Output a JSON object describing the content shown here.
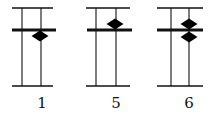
{
  "diagram": {
    "type": "abacus",
    "line_color": "#111111",
    "bead_color": "#000000",
    "frames": [
      {
        "label": "1",
        "top_line": {
          "x1": 12,
          "x2": 53,
          "y": 8
        },
        "bar": {
          "x1": 12,
          "x2": 56,
          "y": 30
        },
        "bottom_line": {
          "x1": 12,
          "x2": 53,
          "y": 86
        },
        "rods": [
          22,
          41
        ],
        "beads": [
          {
            "cx": 40,
            "cy": 36
          }
        ],
        "label_x": 42
      },
      {
        "label": "5",
        "top_line": {
          "x1": 86,
          "x2": 130,
          "y": 8
        },
        "bar": {
          "x1": 87,
          "x2": 132,
          "y": 30
        },
        "bottom_line": {
          "x1": 86,
          "x2": 130,
          "y": 86
        },
        "rods": [
          96,
          116
        ],
        "beads": [
          {
            "cx": 115,
            "cy": 24
          }
        ],
        "label_x": 116
      },
      {
        "label": "6",
        "top_line": {
          "x1": 157,
          "x2": 203,
          "y": 8
        },
        "bar": {
          "x1": 157,
          "x2": 203,
          "y": 30
        },
        "bottom_line": {
          "x1": 157,
          "x2": 203,
          "y": 86
        },
        "rods": [
          171,
          189
        ],
        "beads": [
          {
            "cx": 189,
            "cy": 24
          },
          {
            "cx": 189,
            "cy": 37
          }
        ],
        "label_x": 189
      }
    ],
    "label_y": 108
  }
}
